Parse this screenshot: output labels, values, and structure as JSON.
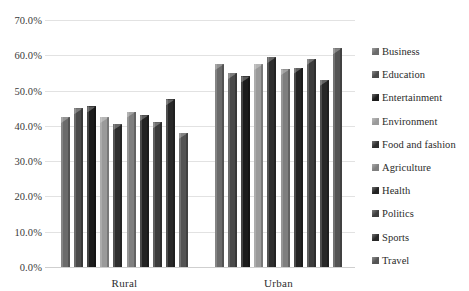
{
  "chart_data": {
    "type": "bar",
    "title": "",
    "subtitle": "",
    "xlabel": "",
    "ylabel": "",
    "categories": [
      "Rural",
      "Urban"
    ],
    "ylim": [
      0,
      70
    ],
    "ytick_step": 10,
    "ytick_labels": [
      "70.0%",
      "60.0%",
      "50.0%",
      "40.0%",
      "30.0%",
      "20.0%",
      "10.0%",
      "0.0%"
    ],
    "ytick_values": [
      70,
      60,
      50,
      40,
      30,
      20,
      10,
      0
    ],
    "grid": true,
    "legend_position": "right",
    "value_suffix": "%",
    "series": [
      {
        "name": "Business",
        "color": "#6b6b6b",
        "values": [
          42.5,
          57.5
        ]
      },
      {
        "name": "Education",
        "color": "#4a4a4a",
        "values": [
          45.0,
          55.0
        ]
      },
      {
        "name": "Entertainment",
        "color": "#1c1c1c",
        "values": [
          45.5,
          54.0
        ]
      },
      {
        "name": "Environment",
        "color": "#9a9a9a",
        "values": [
          42.5,
          57.5
        ]
      },
      {
        "name": "Food and fashion",
        "color": "#2e2e2e",
        "values": [
          40.5,
          59.5
        ]
      },
      {
        "name": "Agriculture",
        "color": "#7f7f7f",
        "values": [
          44.0,
          56.0
        ]
      },
      {
        "name": "Health",
        "color": "#232323",
        "values": [
          43.0,
          56.5
        ]
      },
      {
        "name": "Politics",
        "color": "#3c3c3c",
        "values": [
          41.0,
          59.0
        ]
      },
      {
        "name": "Sports",
        "color": "#282828",
        "values": [
          47.5,
          53.0
        ]
      },
      {
        "name": "Travel",
        "color": "#545454",
        "values": [
          38.0,
          62.0
        ]
      }
    ]
  }
}
